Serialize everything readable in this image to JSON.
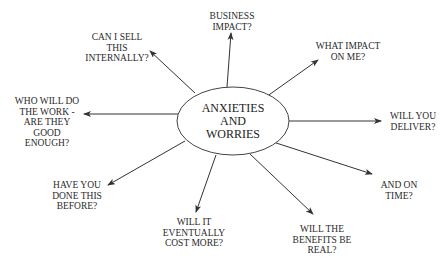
{
  "diagram": {
    "type": "mind-map",
    "center": {
      "lines": [
        "ANXIETIES",
        "AND",
        "WORRIES"
      ],
      "cx": 233,
      "cy": 121,
      "rx": 56,
      "ry": 34
    },
    "colors": {
      "line": "#333333",
      "text": "#2a2a2a",
      "background": "#ffffff"
    },
    "nodes": [
      {
        "id": "business-impact",
        "lines": [
          "BUSINESS",
          "IMPACT?"
        ],
        "x": 232,
        "y": 11,
        "from": [
          227,
          87
        ],
        "to": [
          231,
          33
        ]
      },
      {
        "id": "what-impact-on-me",
        "lines": [
          "WHAT IMPACT",
          "ON ME?"
        ],
        "x": 348,
        "y": 41,
        "from": [
          266,
          97
        ],
        "to": [
          318,
          60
        ]
      },
      {
        "id": "will-you-deliver",
        "lines": [
          "WILL YOU",
          "DELIVER?"
        ],
        "x": 413,
        "y": 111,
        "from": [
          289,
          121
        ],
        "to": [
          381,
          121
        ]
      },
      {
        "id": "and-on-time",
        "lines": [
          "AND ON",
          "TIME?"
        ],
        "x": 399,
        "y": 180,
        "from": [
          270,
          141
        ],
        "to": [
          372,
          174
        ]
      },
      {
        "id": "will-the-benefits-be-real",
        "lines": [
          "WILL THE",
          "BENEFITS BE",
          "REAL?"
        ],
        "x": 322,
        "y": 224,
        "from": [
          250,
          154
        ],
        "to": [
          313,
          214
        ]
      },
      {
        "id": "will-it-eventually-cost-more",
        "lines": [
          "WILL IT",
          "EVENTUALLY",
          "COST MORE?"
        ],
        "x": 194,
        "y": 217,
        "from": [
          216,
          155
        ],
        "to": [
          196,
          212
        ]
      },
      {
        "id": "have-you-done-this-before",
        "lines": [
          "HAVE YOU",
          "DONE THIS",
          "BEFORE?"
        ],
        "x": 77,
        "y": 180,
        "from": [
          185,
          141
        ],
        "to": [
          108,
          185
        ]
      },
      {
        "id": "who-will-do-the-work",
        "lines": [
          "WHO WILL DO",
          "THE WORK -",
          "ARE THEY",
          "GOOD",
          "ENOUGH?"
        ],
        "x": 47,
        "y": 96,
        "from": [
          178,
          114
        ],
        "to": [
          84,
          114
        ]
      },
      {
        "id": "can-i-sell-this-internally",
        "lines": [
          "CAN I SELL",
          "THIS",
          "INTERNALLY?"
        ],
        "x": 117,
        "y": 32,
        "from": [
          195,
          93
        ],
        "to": [
          150,
          51
        ]
      }
    ]
  }
}
